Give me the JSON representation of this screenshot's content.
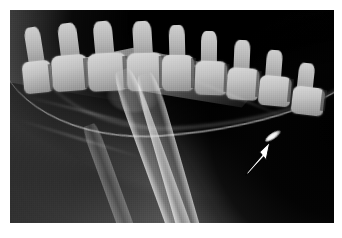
{
  "figure": {
    "type": "radiograph",
    "modality": "X-ray",
    "view": "lateral",
    "caption": "",
    "border_color": "#ffffff",
    "background_color": "#000000",
    "width": 342,
    "height": 238
  },
  "plate": {
    "left": 10,
    "top": 10,
    "width": 324,
    "height": 213,
    "air_color": "#000000",
    "soft_tissue_color": "#8a8a8a",
    "bone_color": "#d8d8d8"
  },
  "annotation": {
    "marker": "arrow",
    "marker_color": "#ffffff",
    "marker_outline_color": "#000000",
    "points_to": "lesion",
    "tip_x": 268,
    "tip_y": 143,
    "tail_x": 249,
    "tail_y": 173,
    "label": ""
  },
  "finding": {
    "name": "lesion",
    "appearance": "focal bright opacity",
    "color": "#fdfdfd",
    "x": 273,
    "y": 136
  },
  "anatomy": {
    "structures": [
      {
        "name": "cervicothoracic-vertebral-column",
        "opacity": "bone"
      },
      {
        "name": "spinous-processes",
        "opacity": "bone"
      },
      {
        "name": "scapula",
        "opacity": "bone"
      },
      {
        "name": "humerus",
        "opacity": "bone"
      },
      {
        "name": "radius-ulna",
        "opacity": "bone"
      },
      {
        "name": "soft-tissue-thorax",
        "opacity": "soft-tissue"
      },
      {
        "name": "air-background",
        "opacity": "air"
      }
    ],
    "vertebrae": [
      {
        "x": 4,
        "y": 24,
        "w": 9,
        "h": 15,
        "sp_x": 5,
        "sp_y": 8,
        "sp_w": 5,
        "sp_h": 17
      },
      {
        "x": 13,
        "y": 21,
        "w": 11,
        "h": 17,
        "sp_x": 15,
        "sp_y": 6,
        "sp_w": 6,
        "sp_h": 17
      },
      {
        "x": 24,
        "y": 20,
        "w": 12,
        "h": 18,
        "sp_x": 26,
        "sp_y": 5,
        "sp_w": 6,
        "sp_h": 17
      },
      {
        "x": 36,
        "y": 20,
        "w": 11,
        "h": 18,
        "sp_x": 38,
        "sp_y": 5,
        "sp_w": 6,
        "sp_h": 17
      },
      {
        "x": 47,
        "y": 21,
        "w": 10,
        "h": 17,
        "sp_x": 49,
        "sp_y": 7,
        "sp_w": 5,
        "sp_h": 16
      },
      {
        "x": 57,
        "y": 24,
        "w": 10,
        "h": 16,
        "sp_x": 59,
        "sp_y": 10,
        "sp_w": 5,
        "sp_h": 16
      },
      {
        "x": 67,
        "y": 27,
        "w": 10,
        "h": 15,
        "sp_x": 69,
        "sp_y": 14,
        "sp_w": 5,
        "sp_h": 15
      },
      {
        "x": 77,
        "y": 31,
        "w": 10,
        "h": 14,
        "sp_x": 79,
        "sp_y": 19,
        "sp_w": 5,
        "sp_h": 14
      },
      {
        "x": 87,
        "y": 36,
        "w": 10,
        "h": 13,
        "sp_x": 89,
        "sp_y": 25,
        "sp_w": 5,
        "sp_h": 13
      }
    ]
  }
}
